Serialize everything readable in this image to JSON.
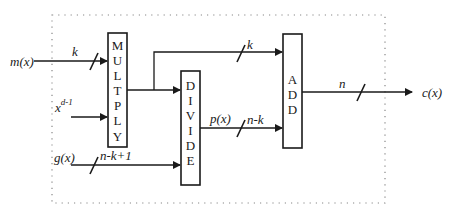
{
  "diagram": {
    "inputs": {
      "message": "m(x)",
      "shift": "x",
      "shift_exponent": "d-1",
      "generator": "g(x)"
    },
    "output": "c(x)",
    "blocks": {
      "multiply": [
        "M",
        "U",
        "L",
        "T",
        "P",
        "L",
        "Y"
      ],
      "divide": [
        "D",
        "I",
        "V",
        "I",
        "D",
        "E"
      ],
      "add": [
        "A",
        "D",
        "D"
      ]
    },
    "bus_widths": {
      "message": "k",
      "generator": "n-k+1",
      "bypass": "k",
      "remainder": "n-k",
      "output": "n"
    },
    "signals": {
      "remainder": "p(x)"
    },
    "colors": {
      "line": "#1a1a1a",
      "frame": "#888888",
      "background": "#ffffff"
    }
  }
}
